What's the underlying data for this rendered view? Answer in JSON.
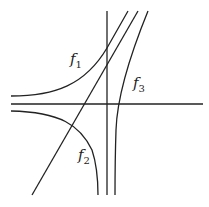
{
  "diagram": {
    "stroke_color": "#222222",
    "background": "#ffffff",
    "labels": [
      {
        "name": "f",
        "sub": "1",
        "x": 70,
        "y": 58
      },
      {
        "name": "f",
        "sub": "2",
        "x": 78,
        "y": 150
      },
      {
        "name": "f",
        "sub": "3",
        "x": 133,
        "y": 78
      }
    ]
  }
}
